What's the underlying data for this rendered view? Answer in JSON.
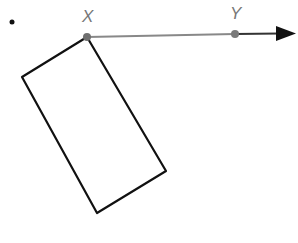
{
  "diagram": {
    "bullet": "•",
    "points": [
      {
        "name": "X",
        "x": 87,
        "y": 37,
        "label_x": 82,
        "label_y": 22
      },
      {
        "name": "Y",
        "x": 235,
        "y": 34,
        "label_x": 230,
        "label_y": 19
      }
    ],
    "ray": {
      "from": "X",
      "through": "Y",
      "x1": 87,
      "y1": 37,
      "x2": 282,
      "y2": 33.5,
      "tip_x": 295,
      "tip_y": 33.5
    },
    "rectangle": {
      "vertices": [
        [
          87,
          37
        ],
        [
          22,
          77
        ],
        [
          97,
          213
        ],
        [
          166,
          171
        ]
      ]
    },
    "colors": {
      "ray": "#888888",
      "shape": "#111111",
      "point": "#777777",
      "arrow": "#111111"
    }
  }
}
